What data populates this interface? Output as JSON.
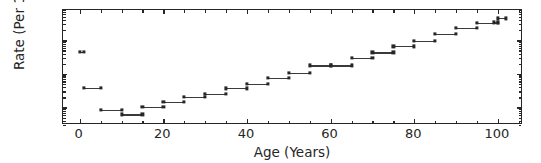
{
  "figure": {
    "background_color": "#ffffff",
    "foreground_color": "#262626",
    "marker_color": "#262626"
  },
  "axis": {
    "xlabel": "Age (Years)",
    "ylabel": "Rate (Per 1)",
    "xticklabels": [
      "0",
      "20",
      "40",
      "60",
      "80",
      "100"
    ],
    "xtickvalues": [
      0,
      20,
      40,
      60,
      80,
      100
    ],
    "yticklabels": [
      "10",
      "10",
      "10"
    ],
    "ytickexponents": [
      "-1",
      "-2",
      "-3"
    ],
    "ytickvalues": [
      0.1,
      0.01,
      0.001
    ]
  },
  "chart_data": {
    "type": "line",
    "title": "",
    "xlabel": "Age (Years)",
    "ylabel": "Rate (Per 1)",
    "yscale": "log",
    "xlim": [
      -4,
      106
    ],
    "ylim": [
      0.0003,
      0.8
    ],
    "grid": false,
    "legend": null,
    "marker": "square",
    "series": [
      {
        "name": "Rate (Per 1)",
        "segments": [
          {
            "x_start": 0,
            "x_end": 1,
            "value": 0.044
          },
          {
            "x_start": 1,
            "x_end": 5,
            "value": 0.0038
          },
          {
            "x_start": 5,
            "x_end": 10,
            "value": 0.00086
          },
          {
            "x_start": 10,
            "x_end": 15,
            "value": 0.00062
          },
          {
            "x_start": 15,
            "x_end": 20,
            "value": 0.00103
          },
          {
            "x_start": 20,
            "x_end": 25,
            "value": 0.0015
          },
          {
            "x_start": 25,
            "x_end": 30,
            "value": 0.00205
          },
          {
            "x_start": 30,
            "x_end": 35,
            "value": 0.00255
          },
          {
            "x_start": 35,
            "x_end": 40,
            "value": 0.0037
          },
          {
            "x_start": 40,
            "x_end": 45,
            "value": 0.0051
          },
          {
            "x_start": 45,
            "x_end": 50,
            "value": 0.0076
          },
          {
            "x_start": 50,
            "x_end": 55,
            "value": 0.0108
          },
          {
            "x_start": 55,
            "x_end": 60,
            "value": 0.0178
          },
          {
            "x_start": 60,
            "x_end": 65,
            "value": 0.0178
          },
          {
            "x_start": 65,
            "x_end": 70,
            "value": 0.0295
          },
          {
            "x_start": 70,
            "x_end": 75,
            "value": 0.0435
          },
          {
            "x_start": 75,
            "x_end": 80,
            "value": 0.066
          },
          {
            "x_start": 80,
            "x_end": 85,
            "value": 0.098
          },
          {
            "x_start": 85,
            "x_end": 90,
            "value": 0.155
          },
          {
            "x_start": 90,
            "x_end": 95,
            "value": 0.23
          },
          {
            "x_start": 95,
            "x_end": 100,
            "value": 0.33
          },
          {
            "x_start": 100,
            "x_end": 102,
            "value": 0.45
          },
          {
            "x_start": 99,
            "x_end": 100,
            "value": 0.34
          }
        ]
      }
    ]
  }
}
